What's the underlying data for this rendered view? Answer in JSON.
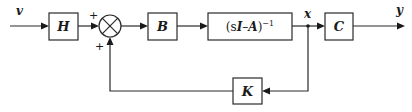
{
  "diagram": {
    "type": "state-feedback block diagram",
    "signals": {
      "input": "v",
      "state": "x",
      "output": "y"
    },
    "blocks": {
      "prefilter": "H",
      "input_matrix": "B",
      "resolvent": {
        "prefix": "(s",
        "I": "I",
        "minus": "–",
        "A": "A",
        "suffix": ")",
        "exponent": "−1"
      },
      "output_matrix": "C",
      "feedback_gain": "K"
    },
    "summing_junction": {
      "signs": [
        "+",
        "+"
      ]
    },
    "colors": {
      "line": "#2a2a2a",
      "background": "#ffffff"
    }
  }
}
